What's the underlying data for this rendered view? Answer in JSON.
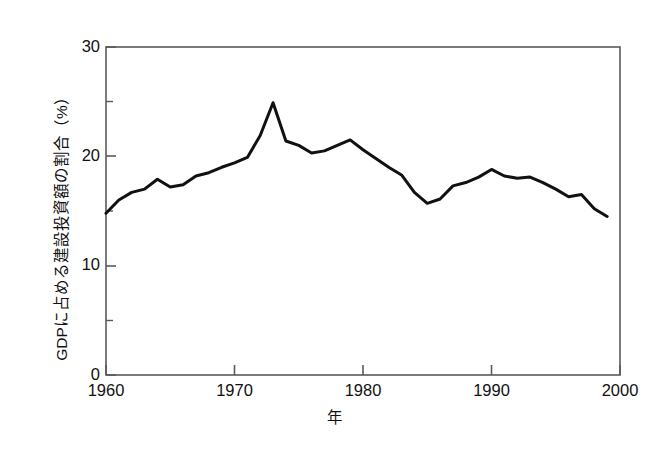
{
  "chart_data": {
    "type": "line",
    "title": "",
    "xlabel": "年",
    "ylabel": "GDPに占める建設投資額の割合（%）",
    "xlim": [
      1960,
      2000
    ],
    "ylim": [
      0,
      30
    ],
    "grid": false,
    "legend": null,
    "xticks": [
      "1960",
      "1970",
      "1980",
      "1990",
      "2000"
    ],
    "xtick_values": [
      1960,
      1970,
      1980,
      1990,
      2000
    ],
    "yticks": [
      "0",
      "10",
      "20",
      "30"
    ],
    "ytick_values": [
      0,
      10,
      20,
      30
    ],
    "yminor_ticks": [
      5,
      15,
      25
    ],
    "x": [
      1960,
      1961,
      1962,
      1963,
      1964,
      1965,
      1966,
      1967,
      1968,
      1969,
      1970,
      1971,
      1972,
      1973,
      1974,
      1975,
      1976,
      1977,
      1978,
      1979,
      1980,
      1981,
      1982,
      1983,
      1984,
      1985,
      1986,
      1987,
      1988,
      1989,
      1990,
      1991,
      1992,
      1993,
      1994,
      1995,
      1996,
      1997,
      1998,
      1999
    ],
    "values": [
      14.8,
      16.0,
      16.7,
      17.0,
      17.9,
      17.2,
      17.4,
      18.2,
      18.5,
      19.0,
      19.4,
      19.9,
      21.9,
      24.9,
      21.4,
      21.0,
      20.3,
      20.5,
      21.0,
      21.5,
      20.6,
      19.8,
      19.0,
      18.3,
      16.7,
      15.7,
      16.1,
      17.3,
      17.6,
      18.1,
      18.8,
      18.2,
      18.0,
      18.1,
      17.6,
      17.0,
      16.3,
      16.5,
      15.2,
      14.5
    ],
    "series": [
      {
        "name": "GDPに占める建設投資額の割合",
        "color": "#111111",
        "line_width": 3,
        "values": [
          14.8,
          16.0,
          16.7,
          17.0,
          17.9,
          17.2,
          17.4,
          18.2,
          18.5,
          19.0,
          19.4,
          19.9,
          21.9,
          24.9,
          21.4,
          21.0,
          20.3,
          20.5,
          21.0,
          21.5,
          20.6,
          19.8,
          19.0,
          18.3,
          16.7,
          15.7,
          16.1,
          17.3,
          17.6,
          18.1,
          18.8,
          18.2,
          18.0,
          18.1,
          17.6,
          17.0,
          16.3,
          16.5,
          15.2,
          14.5
        ]
      }
    ],
    "annotations": {
      "peak_year": 1973,
      "peak_value": 24.9,
      "start_value": 14.8,
      "end_value": 14.5
    }
  },
  "axes": {
    "y_title": "GDPに占める建設投資額の割合（%）",
    "x_title": "年",
    "y_labels": [
      "30",
      "20",
      "10",
      "0"
    ],
    "x_labels": [
      "1960",
      "1970",
      "1980",
      "1990",
      "2000"
    ]
  },
  "colors": {
    "line": "#111111",
    "axis": "#555555",
    "background": "#ffffff",
    "text": "#111111"
  }
}
